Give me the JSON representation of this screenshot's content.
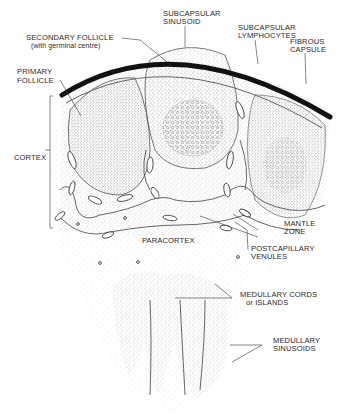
{
  "diagram": {
    "labels": {
      "secondary_follicle": "SECONDARY FOLLICLE",
      "secondary_follicle_note": "(with germinal centre)",
      "subcapsular_sinusoid_1": "SUBCAPSULAR",
      "subcapsular_sinusoid_2": "SINUSOID",
      "subcapsular_lymphocytes_1": "SUBCAPSULAR",
      "subcapsular_lymphocytes_2": "LYMPHOCYTES",
      "fibrous_capsule_1": "FIBROUS",
      "fibrous_capsule_2": "CAPSULE",
      "primary_follicle_1": "PRIMARY",
      "primary_follicle_2": "FOLLICLE",
      "cortex": "CORTEX",
      "mantle_zone_1": "MANTLE",
      "mantle_zone_2": "ZONE",
      "paracortex": "PARACORTEX",
      "postcapillary_venules_1": "POSTCAPILLARY",
      "postcapillary_venules_2": "VENULES",
      "medullary_cords_1": "MEDULLARY CORDS",
      "medullary_cords_2": "or ISLANDS",
      "medullary_sinusoids_1": "MEDULLARY",
      "medullary_sinusoids_2": "SINUSOIDS"
    },
    "colors": {
      "ink": "#1a1a1a",
      "stipple": "#888888",
      "background": "#ffffff"
    }
  }
}
